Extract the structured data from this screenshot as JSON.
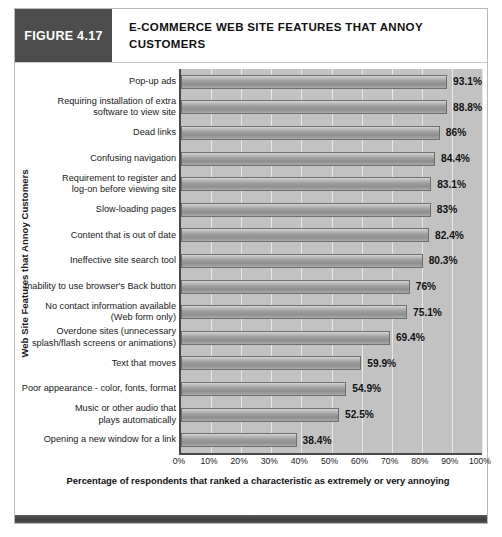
{
  "figure": {
    "tag": "FIGURE 4.17",
    "title": "E-COMMERCE WEB SITE FEATURES THAT ANNOY CUSTOMERS"
  },
  "chart_data": {
    "type": "bar",
    "orientation": "horizontal",
    "title": "E-COMMERCE WEB SITE FEATURES THAT ANNOY CUSTOMERS",
    "xlabel": "Percentage of respondents that ranked a characteristic as extremely or very annoying",
    "ylabel": "Web Site Features that Annoy Customers",
    "xlim": [
      0,
      100
    ],
    "grid": true,
    "legend": "none",
    "xticks": [
      "0%",
      "10%",
      "20%",
      "30%",
      "40%",
      "50%",
      "60%",
      "70%",
      "80%",
      "90%",
      "100%"
    ],
    "categories": [
      "Pop-up ads",
      "Requiring installation of extra software to view site",
      "Dead links",
      "Confusing navigation",
      "Requirement to register and log-on before viewing site",
      "Slow-loading pages",
      "Content that is out of date",
      "Ineffective site search tool",
      "Inability to use browser's Back button",
      "No contact information available (Web form only)",
      "Overdone sites (unnecessary splash/flash screens or animations)",
      "Text that moves",
      "Poor appearance - color, fonts, format",
      "Music or other audio that plays automatically",
      "Opening a new window for a link"
    ],
    "values": [
      93.1,
      88.8,
      86,
      84.4,
      83.1,
      83,
      82.4,
      80.3,
      76,
      75.1,
      69.4,
      59.9,
      54.9,
      52.5,
      38.4
    ],
    "data_labels": [
      "93.1%",
      "88.8%",
      "86%",
      "84.4%",
      "83.1%",
      "83%",
      "82.4%",
      "80.3%",
      "76%",
      "75.1%",
      "69.4%",
      "59.9%",
      "54.9%",
      "52.5%",
      "38.4%"
    ],
    "category_lines": [
      [
        "Pop-up ads"
      ],
      [
        "Requiring installation of extra",
        "software to view site"
      ],
      [
        "Dead links"
      ],
      [
        "Confusing navigation"
      ],
      [
        "Requirement to register and",
        "log-on before viewing site"
      ],
      [
        "Slow-loading pages"
      ],
      [
        "Content that is out of date"
      ],
      [
        "Ineffective site search tool"
      ],
      [
        "Inability to use browser's Back button"
      ],
      [
        "No contact information available",
        "(Web form only)"
      ],
      [
        "Overdone sites (unnecessary",
        "splash/flash screens or animations)"
      ],
      [
        "Text that moves"
      ],
      [
        "Poor appearance - color, fonts, format"
      ],
      [
        "Music or other audio that",
        "plays automatically"
      ],
      [
        "Opening a new window for a link"
      ]
    ]
  },
  "colors": {
    "tag_background": "#4d4d4d",
    "plot_background": "#c2c2c2",
    "bar_fill": "#9c9c9c",
    "bar_border": "#6f6f6f",
    "gridline": "#e8e8e8",
    "axis": "#4a4a4a"
  }
}
